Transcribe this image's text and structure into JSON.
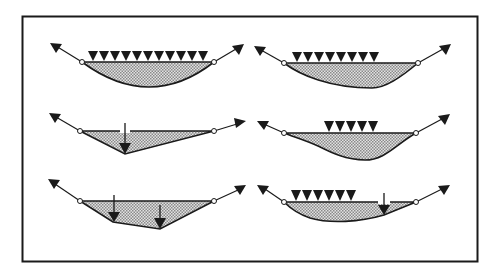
{
  "figure": {
    "colors": {
      "background": "#ffffff",
      "ink": "#1a1a1a",
      "frame": "#1a1a1a",
      "fill_light": "#d4d4d4",
      "fill_dark": "#8a8a8a"
    },
    "frame": {
      "x": 22,
      "y": 16,
      "width": 455,
      "height": 245
    },
    "panels": [
      {
        "id": "top-left",
        "load_type": "uniform-full",
        "distributed_load_count": 11,
        "point_loads": 0,
        "shape": "parabola-symmetric"
      },
      {
        "id": "top-right",
        "load_type": "uniform-partial-left",
        "distributed_load_count": 8,
        "point_loads": 0,
        "shape": "curve-skewed-left"
      },
      {
        "id": "middle-left",
        "load_type": "single-point",
        "distributed_load_count": 0,
        "point_loads": 1,
        "shape": "v-shape"
      },
      {
        "id": "middle-right",
        "load_type": "uniform-partial-center",
        "distributed_load_count": 5,
        "point_loads": 0,
        "shape": "curve-center"
      },
      {
        "id": "bottom-left",
        "load_type": "two-point",
        "distributed_load_count": 0,
        "point_loads": 2,
        "shape": "polygon-trapezoid"
      },
      {
        "id": "bottom-right",
        "load_type": "partial-uniform-plus-point",
        "distributed_load_count": 6,
        "point_loads": 1,
        "shape": "curve-with-kink"
      }
    ]
  }
}
